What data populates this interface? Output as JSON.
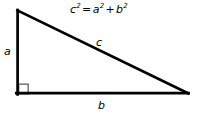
{
  "diagram": {
    "type": "right-triangle",
    "background_color": "#ffffff",
    "stroke_color": "#000000",
    "stroke_width": 2.6,
    "right_angle_marker_color": "#7a7a7a",
    "equation": {
      "base_c": "c",
      "exp_c": "2",
      "equals": "=",
      "base_a": "a",
      "exp_a": "2",
      "plus": "+",
      "base_b": "b",
      "exp_b": "2",
      "full_text": "c2 = a2 + b2"
    },
    "labels": {
      "leg_vertical": "a",
      "hypotenuse": "c",
      "leg_horizontal": "b"
    },
    "vertices": {
      "apex": [
        17,
        10
      ],
      "bottom_left": [
        17,
        94
      ],
      "bottom_right": [
        188,
        94
      ]
    },
    "right_angle_marker": {
      "x": 18,
      "y": 84,
      "size": 10
    }
  }
}
